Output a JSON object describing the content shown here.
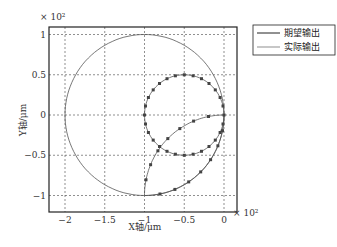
{
  "chart_data": {
    "type": "line",
    "title": "",
    "xlabel": "X轴/μm",
    "ylabel": "Y轴/μm",
    "x_exponent": "× 10²",
    "y_exponent": "× 10²",
    "xlim": [
      -2.2,
      0.1
    ],
    "ylim": [
      -1.12,
      1.1
    ],
    "xticks": [
      -2,
      -1.5,
      -1,
      -0.5,
      0
    ],
    "xtick_labels": [
      "−2",
      "−1.5",
      "−1",
      "−0.5",
      "0"
    ],
    "yticks": [
      1,
      0.5,
      0,
      -0.5,
      -1
    ],
    "ytick_labels": [
      "1",
      "0.5",
      "0",
      "−0.5",
      "−1"
    ],
    "grid": true,
    "legend_position": "outside-right-top",
    "series": [
      {
        "name": "期望输出",
        "style": "solid",
        "description": "Large circle centered (-1,0) radius 1; small circle centered (-0.5,0) radius 0.5; connecting curves from (0,0) to (-1,-1)"
      },
      {
        "name": "实际输出",
        "style": "solid-with-markers",
        "description": "Tracks small circle and lower path with square markers"
      }
    ]
  },
  "legend": {
    "items": [
      {
        "label": "期望输出"
      },
      {
        "label": "实际输出"
      }
    ]
  }
}
